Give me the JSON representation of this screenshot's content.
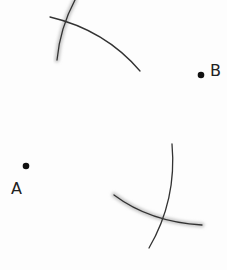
{
  "diagram": {
    "type": "geometric-construction",
    "colors": {
      "background": "#fdfdfd",
      "stroke": "#333333",
      "shadow": "#c8c8c8",
      "point": "#111111"
    },
    "points": [
      {
        "id": "A",
        "label": "A",
        "x": 26,
        "y": 166,
        "label_x": 11,
        "label_y": 194
      },
      {
        "id": "B",
        "label": "B",
        "x": 201,
        "y": 75,
        "label_x": 210,
        "label_y": 76
      }
    ],
    "arcs": [
      {
        "id": "top-steep",
        "path": "M 75 0 Q 60 28 57 60",
        "shadow": true
      },
      {
        "id": "top-shallow",
        "path": "M 50 17 Q 105 30 140 71",
        "shadow": false
      },
      {
        "id": "bottom-steep",
        "path": "M 172 144 Q 177 200 149 248",
        "shadow": false
      },
      {
        "id": "bottom-shallow",
        "path": "M 114 195 Q 150 222 202 225",
        "shadow": true
      }
    ],
    "intersections": [
      {
        "id": "upper",
        "x": 66,
        "y": 20
      },
      {
        "id": "lower",
        "x": 163,
        "y": 220
      }
    ]
  }
}
